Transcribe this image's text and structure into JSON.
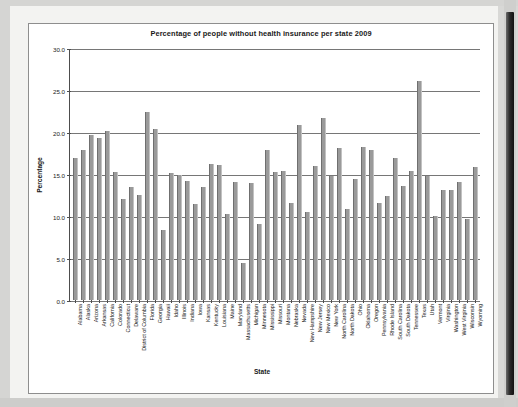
{
  "chart_data": {
    "type": "bar",
    "title": "Percentage of people without health insurance per state 2009",
    "xlabel": "State",
    "ylabel": "Percentage",
    "ylim": [
      0.0,
      30.0
    ],
    "ytick_labels": [
      "0.0",
      "5.0",
      "10.0",
      "15.0",
      "20.0",
      "25.0",
      "30.0"
    ],
    "ytick_values": [
      0.0,
      5.0,
      10.0,
      15.0,
      20.0,
      25.0,
      30.0
    ],
    "grid": "horizontal",
    "legend": "none",
    "bar_color": "#9a9a9a",
    "categories": [
      "Alabama",
      "Alaska",
      "Arizona",
      "Arkansas",
      "California",
      "Colorado",
      "Connecticut",
      "Delaware",
      "District of Columbia",
      "Florida",
      "Georgia",
      "Hawaii",
      "Idaho",
      "Illinois",
      "Indiana",
      "Iowa",
      "Kansas",
      "Kentucky",
      "Louisiana",
      "Maine",
      "Maryland",
      "Massachusetts",
      "Michigan",
      "Minnesota",
      "Mississippi",
      "Missouri",
      "Montana",
      "Nebraska",
      "Nevada",
      "New Hampshire",
      "New Jersey",
      "New Mexico",
      "New York",
      "North Carolina",
      "North Dakota",
      "Ohio",
      "Oklahoma",
      "Oregon",
      "Pennsylvania",
      "Rhode Island",
      "South Carolina",
      "South Dakota",
      "Tennessee",
      "Texas",
      "Utah",
      "Vermont",
      "Virginia",
      "Washington",
      "West Virginia",
      "Wisconsin",
      "Wyoming"
    ],
    "values": [
      16.9,
      17.9,
      19.6,
      19.3,
      20.1,
      15.2,
      12.0,
      13.5,
      12.5,
      22.4,
      20.4,
      8.3,
      15.1,
      14.9,
      14.2,
      11.4,
      13.4,
      16.2,
      16.1,
      10.2,
      14.1,
      4.4,
      13.9,
      9.0,
      17.8,
      15.2,
      15.4,
      11.5,
      20.8,
      10.5,
      15.9,
      21.7,
      14.8,
      18.1,
      10.8,
      14.4,
      18.2,
      17.8,
      11.5,
      12.4,
      16.9,
      13.6,
      15.4,
      26.1,
      14.8,
      10.0,
      13.1,
      13.1,
      14.1,
      9.6,
      15.8
    ]
  },
  "window": {
    "scrollbar_name": "vertical-scrollbar"
  }
}
